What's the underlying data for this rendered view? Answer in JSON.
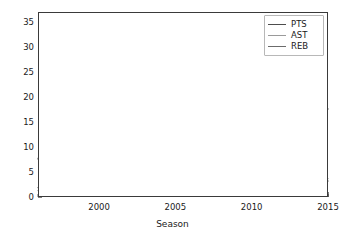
{
  "chart_data": {
    "type": "line",
    "title": "",
    "xlabel": "Season",
    "ylabel": "",
    "x": [
      1996,
      1997,
      1998,
      1999,
      2000,
      2001,
      2002,
      2003,
      2004,
      2005,
      2006,
      2007,
      2008,
      2009,
      2010,
      2011,
      2012,
      2013,
      2014,
      2015
    ],
    "xlim": [
      1996,
      2015
    ],
    "ylim": [
      0,
      37
    ],
    "grid": false,
    "legend_position": "upper right",
    "xticks": [
      2000,
      2005,
      2010,
      2015
    ],
    "xtick_labels": [
      "2000",
      "2005",
      "2010",
      "2015"
    ],
    "yticks": [
      0,
      5,
      10,
      15,
      20,
      25,
      30,
      35
    ],
    "ytick_labels": [
      "0",
      "5",
      "10",
      "15",
      "20",
      "25",
      "30",
      "35"
    ],
    "series": [
      {
        "name": "PTS",
        "color": "#4d4d4d",
        "values": [
          7.6,
          15.4,
          19.9,
          22.5,
          28.5,
          25.2,
          30.0,
          24.0,
          27.6,
          35.4,
          31.6,
          28.3,
          26.8,
          27.0,
          25.3,
          27.9,
          27.3,
          13.8,
          22.3,
          17.6
        ]
      },
      {
        "name": "AST",
        "color": "#9a9a9a",
        "values": [
          1.3,
          2.5,
          3.8,
          4.9,
          5.0,
          5.5,
          5.9,
          5.1,
          6.0,
          4.5,
          5.4,
          5.4,
          4.9,
          5.0,
          4.7,
          4.7,
          5.6,
          6.3,
          5.6,
          3.7
        ]
      },
      {
        "name": "REB",
        "color": "#6b6b6b",
        "values": [
          1.9,
          3.1,
          5.3,
          6.3,
          5.9,
          5.5,
          6.9,
          5.5,
          5.9,
          5.3,
          5.7,
          6.3,
          5.2,
          5.2,
          5.1,
          5.4,
          5.6,
          4.3,
          5.7,
          3.2
        ]
      }
    ]
  },
  "legend": {
    "items": [
      {
        "label": "PTS"
      },
      {
        "label": "AST"
      },
      {
        "label": "REB"
      }
    ]
  },
  "axes": {
    "xlabel": "Season"
  }
}
